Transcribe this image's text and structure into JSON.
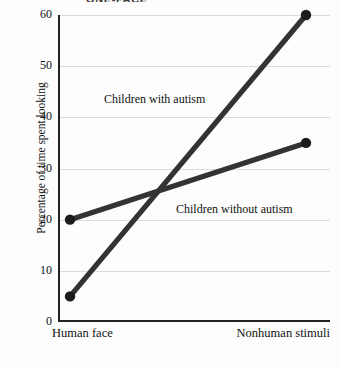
{
  "figure": {
    "title_sliver": "ONE-FACE",
    "background_color": "#fdfdfd",
    "line_color": "#333333",
    "marker_color": "#1c1c1c",
    "gridline_color": "#dcdcdc",
    "axis_color": "#222222"
  },
  "chart_data": {
    "type": "line",
    "title": "",
    "xlabel": "",
    "ylabel": "Percentage of time spent looking",
    "categories": [
      "Human face",
      "Nonhuman stimuli"
    ],
    "series": [
      {
        "name": "Children with autism",
        "values": [
          5,
          60
        ]
      },
      {
        "name": "Children without autism",
        "values": [
          20,
          35
        ]
      }
    ],
    "ylim": [
      0,
      60
    ],
    "yticks": [
      0,
      10,
      20,
      30,
      40,
      50,
      60
    ],
    "ytick_labels": [
      "0",
      "10",
      "20",
      "30",
      "40",
      "50",
      "60"
    ],
    "grid": true,
    "legend": "inline-annotations",
    "annotations": [
      {
        "text": "Children with autism",
        "series": 0
      },
      {
        "text": "Children without autism",
        "series": 1
      }
    ]
  }
}
